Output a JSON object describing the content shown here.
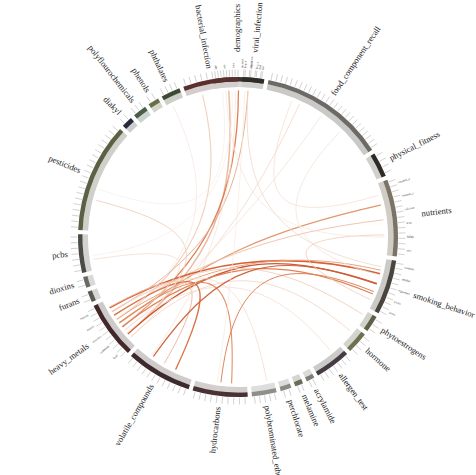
{
  "figure": {
    "title": "",
    "type": "chord-diagram",
    "center_x": 238,
    "center_y": 237,
    "outer_radius": 158,
    "inner_radius": 150,
    "background": "#ffffff",
    "focus_node": "heavy_metals",
    "focus_point": {
      "x": 231,
      "y": 377
    }
  },
  "chart_data": {
    "type": "chord",
    "title": "",
    "xlabel": "",
    "ylabel": "",
    "legend_position": "none",
    "grid": false,
    "categories": [
      "demographics",
      "food_component_recall",
      "physical_fitness",
      "nutrients",
      "smoking_behavior",
      "phytoestrogens",
      "hormone",
      "allergen_test",
      "acrylamide",
      "melamine",
      "perchlorate",
      "polybrominated_ethers",
      "hydrocarbons",
      "volatile_compounds",
      "heavy_metals",
      "furans",
      "dioxins",
      "pcbs",
      "pesticides",
      "diakyl",
      "polyflourochemicals",
      "phenols",
      "phthalates",
      "bacterial_infection",
      "viral_infection"
    ],
    "values": [
      18,
      46,
      9,
      28,
      20,
      6,
      8,
      13,
      3,
      3,
      4,
      9,
      20,
      24,
      21,
      4,
      4,
      14,
      40,
      4,
      5,
      4,
      7,
      20,
      8
    ],
    "value_label": "sector span (degrees)",
    "colors": [
      "#3b3530",
      "#6d6a66",
      "#2e2b27",
      "#7a7366",
      "#4a443e",
      "#5e6047",
      "#6e7050",
      "#443b45",
      "#7d7d78",
      "#6a6c55",
      "#8a8a85",
      "#8e8e8a",
      "#4a3134",
      "#3d2a2c",
      "#42282b",
      "#5a5a54",
      "#6a6a64",
      "#4a4a46",
      "#5c6145",
      "#262a38",
      "#4a5c4a",
      "#697049",
      "#3e4a36",
      "#5a2f2e",
      "#2f2c27"
    ],
    "ribbon_colors": [
      "#d96c3f",
      "#e0855c",
      "#eeb79a",
      "#f3d4c2",
      "#f7e6dc",
      "#c4552e"
    ],
    "ribbon_hub": "heavy_metals",
    "secondary_hub": "smoking_behavior"
  },
  "sectors": [
    {
      "label": "demographics",
      "start_deg": -99.0,
      "end_deg": -81.0,
      "color": "#3b3530",
      "band": "#d8d8d6",
      "ticks": 9,
      "sub_labels": [
        "age",
        "sex",
        "race",
        "income",
        "education",
        "bmi"
      ]
    },
    {
      "label": "food_component_recall",
      "start_deg": -79.0,
      "end_deg": -33.0,
      "color": "#6d6a66",
      "band": "#c9c9c7",
      "ticks": 26,
      "sub_labels": []
    },
    {
      "label": "physical_fitness",
      "start_deg": -31.5,
      "end_deg": -22.5,
      "color": "#2e2b27",
      "band": "#d0d0ce",
      "ticks": 4,
      "sub_labels": []
    },
    {
      "label": "nutrients",
      "start_deg": -21.0,
      "end_deg": 7.0,
      "color": "#7a7366",
      "band": "#cfcdc6",
      "ticks": 15,
      "sub_labels": [
        "vitamin_a",
        "vitamin_c",
        "calcium",
        "iron",
        "folate",
        "zinc"
      ]
    },
    {
      "label": "smoking_behavior",
      "start_deg": 8.5,
      "end_deg": 28.5,
      "color": "#4a443e",
      "band": "#cccac6",
      "ticks": 11,
      "sub_labels": [
        "cotinine",
        "smoker",
        "cigarettes",
        "packs",
        "years"
      ]
    },
    {
      "label": "phytoestrogens",
      "start_deg": 30.0,
      "end_deg": 36.0,
      "color": "#5e6047",
      "band": "#d2d2cc",
      "ticks": 3,
      "sub_labels": []
    },
    {
      "label": "hormone",
      "start_deg": 37.5,
      "end_deg": 45.5,
      "color": "#6e7050",
      "band": "#d4d4ce",
      "ticks": 4,
      "sub_labels": []
    },
    {
      "label": "allergen_test",
      "start_deg": 47.0,
      "end_deg": 60.0,
      "color": "#443b45",
      "band": "#cbcbc9",
      "ticks": 7,
      "sub_labels": []
    },
    {
      "label": "acrylamide",
      "start_deg": 61.5,
      "end_deg": 64.5,
      "color": "#7d7d78",
      "band": "#dadad8",
      "ticks": 2,
      "sub_labels": []
    },
    {
      "label": "melamine",
      "start_deg": 66.0,
      "end_deg": 69.0,
      "color": "#6a6c55",
      "band": "#d6d6d0",
      "ticks": 2,
      "sub_labels": []
    },
    {
      "label": "perchlorate",
      "start_deg": 70.5,
      "end_deg": 74.5,
      "color": "#8a8a85",
      "band": "#dcdcda",
      "ticks": 2,
      "sub_labels": []
    },
    {
      "label": "polybrominated_ethers",
      "start_deg": 76.0,
      "end_deg": 85.0,
      "color": "#8e8e8a",
      "band": "#dedede",
      "ticks": 5,
      "sub_labels": []
    },
    {
      "label": "hydrocarbons",
      "start_deg": 86.5,
      "end_deg": 106.5,
      "color": "#4a3134",
      "band": "#d3cfcf",
      "ticks": 10,
      "sub_labels": []
    },
    {
      "label": "volatile_compounds",
      "start_deg": 108.0,
      "end_deg": 132.0,
      "color": "#3d2a2c",
      "band": "#d0cbcb",
      "ticks": 12,
      "sub_labels": []
    },
    {
      "label": "heavy_metals",
      "start_deg": 133.5,
      "end_deg": 154.5,
      "color": "#42282b",
      "band": "#cfcaca",
      "ticks": 11,
      "sub_labels": [
        "lead",
        "cadmium",
        "mercury",
        "arsenic",
        "barium"
      ]
    },
    {
      "label": "furans",
      "start_deg": 156.0,
      "end_deg": 160.0,
      "color": "#5a5a54",
      "band": "#d7d7d5",
      "ticks": 2,
      "sub_labels": []
    },
    {
      "label": "dioxins",
      "start_deg": 161.5,
      "end_deg": 165.5,
      "color": "#6a6a64",
      "band": "#d9d9d7",
      "ticks": 2,
      "sub_labels": []
    },
    {
      "label": "pcbs",
      "start_deg": 167.0,
      "end_deg": 181.0,
      "color": "#4a4a46",
      "band": "#d2d2d0",
      "ticks": 7,
      "sub_labels": []
    },
    {
      "label": "pesticides",
      "start_deg": 182.5,
      "end_deg": 222.5,
      "color": "#5c6145",
      "band": "#cfd0c9",
      "ticks": 20,
      "sub_labels": []
    },
    {
      "label": "diakyl",
      "start_deg": 224.0,
      "end_deg": 228.0,
      "color": "#262a38",
      "band": "#cccdd3",
      "ticks": 2,
      "sub_labels": []
    },
    {
      "label": "polyflourochemicals",
      "start_deg": 229.5,
      "end_deg": 234.5,
      "color": "#4a5c4a",
      "band": "#ccd2cc",
      "ticks": 3,
      "sub_labels": []
    },
    {
      "label": "phenols",
      "start_deg": 236.0,
      "end_deg": 240.0,
      "color": "#697049",
      "band": "#d4d6c9",
      "ticks": 2,
      "sub_labels": []
    },
    {
      "label": "phthalates",
      "start_deg": 241.5,
      "end_deg": 248.5,
      "color": "#3e4a36",
      "band": "#cbd0c7",
      "ticks": 4,
      "sub_labels": []
    },
    {
      "label": "bacterial_infection",
      "start_deg": 250.0,
      "end_deg": 270.0,
      "color": "#5a2f2e",
      "band": "#d3cdcd",
      "ticks": 10,
      "sub_labels": []
    },
    {
      "label": "viral_infection",
      "start_deg": 271.5,
      "end_deg": 279.5,
      "color": "#2f2c27",
      "band": "#d0d0ce",
      "ticks": 4,
      "sub_labels": [
        "hep_a",
        "hep_b",
        "hep_c",
        "hsv"
      ]
    }
  ],
  "ribbons": [
    {
      "from": "heavy_metals",
      "to": "demographics",
      "color": "#e9b79c",
      "width": 1.5
    },
    {
      "from": "heavy_metals",
      "to": "demographics",
      "color": "#d97a4e",
      "width": 1.3
    },
    {
      "from": "heavy_metals",
      "to": "bacterial_infection",
      "color": "#f0cdb8",
      "width": 1.1
    },
    {
      "from": "heavy_metals",
      "to": "viral_infection",
      "color": "#e7ad90",
      "width": 1.0
    },
    {
      "from": "heavy_metals",
      "to": "food_component_recall",
      "color": "#f4ddd0",
      "width": 1.0
    },
    {
      "from": "heavy_metals",
      "to": "food_component_recall",
      "color": "#f6e4da",
      "width": 0.9
    },
    {
      "from": "heavy_metals",
      "to": "nutrients",
      "color": "#e09064",
      "width": 1.2
    },
    {
      "from": "heavy_metals",
      "to": "nutrients",
      "color": "#efc2aa",
      "width": 1.0
    },
    {
      "from": "heavy_metals",
      "to": "smoking_behavior",
      "color": "#d2592c",
      "width": 1.6
    },
    {
      "from": "heavy_metals",
      "to": "smoking_behavior",
      "color": "#c9502a",
      "width": 1.4
    },
    {
      "from": "heavy_metals",
      "to": "smoking_behavior",
      "color": "#de7c4f",
      "width": 1.2
    },
    {
      "from": "heavy_metals",
      "to": "smoking_behavior",
      "color": "#e8a27c",
      "width": 1.0
    },
    {
      "from": "heavy_metals",
      "to": "phytoestrogens",
      "color": "#f1cdb8",
      "width": 0.9
    },
    {
      "from": "heavy_metals",
      "to": "hormone",
      "color": "#f3d6c5",
      "width": 0.9
    },
    {
      "from": "heavy_metals",
      "to": "allergen_test",
      "color": "#f5e0d4",
      "width": 0.9
    },
    {
      "from": "heavy_metals",
      "to": "hydrocarbons",
      "color": "#e08a5c",
      "width": 1.1
    },
    {
      "from": "heavy_metals",
      "to": "volatile_compounds",
      "color": "#d96c3f",
      "width": 1.3
    },
    {
      "from": "heavy_metals",
      "to": "volatile_compounds",
      "color": "#ecb79b",
      "width": 1.0
    },
    {
      "from": "heavy_metals",
      "to": "pesticides",
      "color": "#f2d2c0",
      "width": 1.0
    },
    {
      "from": "heavy_metals",
      "to": "pcbs",
      "color": "#f5dfd3",
      "width": 0.9
    },
    {
      "from": "heavy_metals",
      "to": "phthalates",
      "color": "#f6e6dd",
      "width": 0.8
    },
    {
      "from": "heavy_metals",
      "to": "polybrominated_ethers",
      "color": "#f4dace",
      "width": 0.8
    },
    {
      "from": "smoking_behavior",
      "to": "demographics",
      "color": "#f3d9cb",
      "width": 0.9
    },
    {
      "from": "smoking_behavior",
      "to": "food_component_recall",
      "color": "#f5e2d8",
      "width": 0.8
    },
    {
      "from": "smoking_behavior",
      "to": "volatile_compounds",
      "color": "#cf5c31",
      "width": 1.2
    },
    {
      "from": "smoking_behavior",
      "to": "hydrocarbons",
      "color": "#dd7d50",
      "width": 1.0
    },
    {
      "from": "smoking_behavior",
      "to": "nutrients",
      "color": "#f0c8b2",
      "width": 0.8
    },
    {
      "from": "nutrients",
      "to": "demographics",
      "color": "#f6e7de",
      "width": 0.8
    },
    {
      "from": "nutrients",
      "to": "food_component_recall",
      "color": "#f4ded2",
      "width": 0.8
    },
    {
      "from": "volatile_compounds",
      "to": "demographics",
      "color": "#f5e3d9",
      "width": 0.8
    },
    {
      "from": "hydrocarbons",
      "to": "demographics",
      "color": "#f6e8e0",
      "width": 0.7
    },
    {
      "from": "pesticides",
      "to": "demographics",
      "color": "#f7ece6",
      "width": 0.7
    },
    {
      "from": "pcbs",
      "to": "demographics",
      "color": "#f7ebe4",
      "width": 0.7
    }
  ]
}
